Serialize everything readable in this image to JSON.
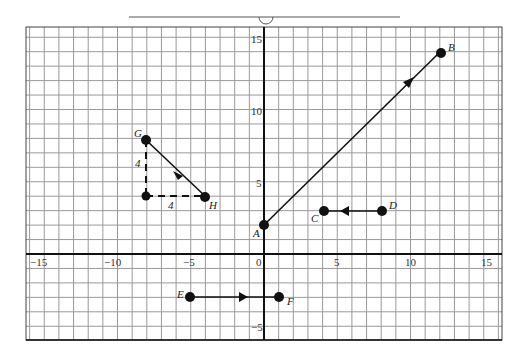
{
  "figure": {
    "title": "",
    "grid": {
      "x_range": [
        -16,
        16
      ],
      "y_range": [
        -6,
        15.6
      ],
      "x_ticks": [
        {
          "value": -15,
          "label": "−15"
        },
        {
          "value": -10,
          "label": "−10"
        },
        {
          "value": -5,
          "label": "−5"
        },
        {
          "value": 0,
          "label": "0"
        },
        {
          "value": 5,
          "label": "5"
        },
        {
          "value": 10,
          "label": "10"
        },
        {
          "value": 15,
          "label": "15"
        }
      ],
      "y_ticks": [
        {
          "value": 15,
          "label": "15"
        },
        {
          "value": 10,
          "label": "10"
        },
        {
          "value": 5,
          "label": "5"
        },
        {
          "value": -5,
          "label": "−5"
        }
      ],
      "grid_color": "#9a9a9a",
      "axis_color": "#111111"
    },
    "points": {
      "A": {
        "label": "A",
        "x": 0,
        "y": 2
      },
      "B": {
        "label": "B",
        "x": 12,
        "y": 14
      },
      "C": {
        "label": "C",
        "x": 4,
        "y": 3
      },
      "D": {
        "label": "D",
        "x": 8,
        "y": 3
      },
      "E": {
        "label": "E",
        "x": -5,
        "y": -3
      },
      "F": {
        "label": "F",
        "x": 1,
        "y": -3
      },
      "G": {
        "label": "G",
        "x": -8,
        "y": 8
      },
      "H": {
        "label": "H",
        "x": -4,
        "y": 4
      }
    },
    "vectors": [
      {
        "from": "A",
        "to": "B"
      },
      {
        "from": "D",
        "to": "C"
      },
      {
        "from": "E",
        "to": "F"
      },
      {
        "from": "G",
        "to": "H"
      }
    ],
    "components": {
      "vertical_label": "4",
      "horizontal_label": "4",
      "corner": {
        "x": -8,
        "y": 4
      }
    }
  }
}
